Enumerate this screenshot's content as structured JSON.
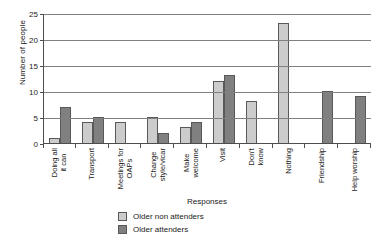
{
  "chart_data": {
    "type": "bar",
    "title": "",
    "xlabel": "Responses",
    "ylabel": "Number of people",
    "ylim": [
      0,
      25
    ],
    "ytick_step": 5,
    "yticks": [
      0,
      5,
      10,
      15,
      20,
      25
    ],
    "grid": "horizontal",
    "legend_position": "bottom-left",
    "categories": [
      "Doing all it can",
      "Transport",
      "Meetings for OAPs",
      "Change style/vicar",
      "Make welcome",
      "Visit",
      "Don't know",
      "Nothing",
      "Friendship",
      "Help worship"
    ],
    "category_lines": [
      [
        "Doing all",
        "it can"
      ],
      [
        "Transport"
      ],
      [
        "Meetings  for",
        "OAPs"
      ],
      [
        "Change",
        "style/vicar"
      ],
      [
        "Make",
        "welcome"
      ],
      [
        "Visit"
      ],
      [
        "Don't",
        "know"
      ],
      [
        "Nothing"
      ],
      [
        "Friendship"
      ],
      [
        "Help worship"
      ]
    ],
    "series": [
      {
        "name": "Older non attenders",
        "color": "#cccccc",
        "values": [
          1,
          4,
          4,
          5,
          3,
          12,
          8,
          23,
          0,
          0
        ]
      },
      {
        "name": "Older attenders",
        "color": "#808080",
        "values": [
          7,
          5,
          0,
          2,
          4,
          13,
          0,
          0,
          10,
          9
        ]
      }
    ]
  }
}
